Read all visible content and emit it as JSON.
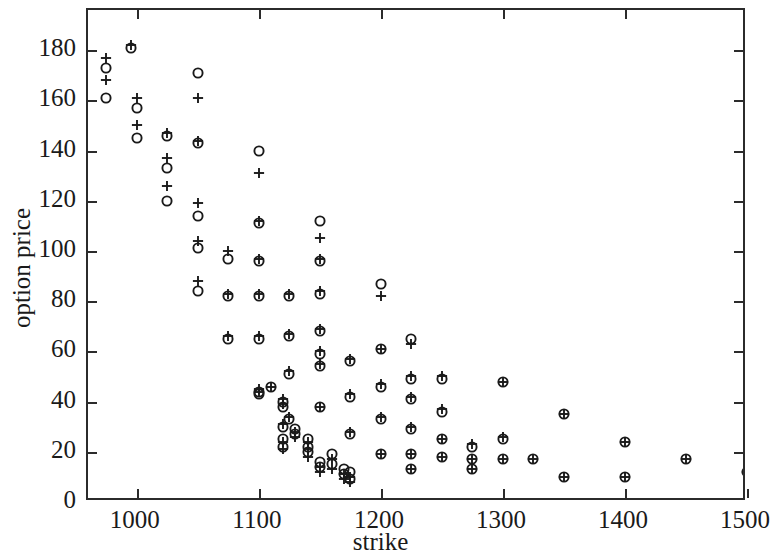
{
  "chart_data": {
    "type": "scatter",
    "title": "",
    "xlabel": "strike",
    "ylabel": "option price",
    "xlim": [
      960,
      1500
    ],
    "ylim": [
      0,
      196
    ],
    "grid": false,
    "legend": null,
    "xticks": [
      1000,
      1100,
      1200,
      1300,
      1400,
      1500
    ],
    "yticks": [
      0,
      20,
      40,
      60,
      80,
      100,
      120,
      140,
      160,
      180
    ],
    "series": [
      {
        "name": "circle",
        "marker": "o",
        "points": [
          [
            975,
            173
          ],
          [
            975,
            161
          ],
          [
            995,
            181
          ],
          [
            1000,
            157
          ],
          [
            1000,
            145
          ],
          [
            1025,
            146
          ],
          [
            1025,
            133
          ],
          [
            1025,
            120
          ],
          [
            1050,
            171
          ],
          [
            1050,
            143
          ],
          [
            1050,
            114
          ],
          [
            1050,
            101
          ],
          [
            1050,
            84
          ],
          [
            1075,
            97
          ],
          [
            1075,
            82
          ],
          [
            1075,
            65
          ],
          [
            1100,
            140
          ],
          [
            1100,
            111
          ],
          [
            1100,
            96
          ],
          [
            1100,
            82
          ],
          [
            1100,
            65
          ],
          [
            1100,
            44
          ],
          [
            1100,
            43
          ],
          [
            1110,
            46
          ],
          [
            1120,
            40
          ],
          [
            1120,
            38
          ],
          [
            1120,
            30
          ],
          [
            1120,
            25
          ],
          [
            1120,
            22
          ],
          [
            1125,
            82
          ],
          [
            1125,
            66
          ],
          [
            1125,
            51
          ],
          [
            1125,
            33
          ],
          [
            1130,
            29
          ],
          [
            1130,
            27
          ],
          [
            1140,
            25
          ],
          [
            1140,
            22
          ],
          [
            1140,
            20
          ],
          [
            1150,
            112
          ],
          [
            1150,
            96
          ],
          [
            1150,
            83
          ],
          [
            1150,
            68
          ],
          [
            1150,
            59
          ],
          [
            1150,
            54
          ],
          [
            1150,
            38
          ],
          [
            1150,
            16
          ],
          [
            1150,
            14
          ],
          [
            1160,
            19
          ],
          [
            1160,
            15
          ],
          [
            1170,
            13
          ],
          [
            1170,
            11
          ],
          [
            1175,
            56
          ],
          [
            1175,
            42
          ],
          [
            1175,
            27
          ],
          [
            1175,
            12
          ],
          [
            1175,
            9
          ],
          [
            1200,
            87
          ],
          [
            1200,
            61
          ],
          [
            1200,
            46
          ],
          [
            1200,
            33
          ],
          [
            1200,
            19
          ],
          [
            1225,
            65
          ],
          [
            1225,
            49
          ],
          [
            1225,
            41
          ],
          [
            1225,
            29
          ],
          [
            1225,
            19
          ],
          [
            1225,
            13
          ],
          [
            1250,
            49
          ],
          [
            1250,
            36
          ],
          [
            1250,
            25
          ],
          [
            1250,
            18
          ],
          [
            1275,
            22
          ],
          [
            1275,
            17
          ],
          [
            1275,
            13
          ],
          [
            1300,
            48
          ],
          [
            1300,
            25
          ],
          [
            1300,
            17
          ],
          [
            1325,
            17
          ],
          [
            1350,
            35
          ],
          [
            1350,
            10
          ],
          [
            1400,
            24
          ],
          [
            1400,
            10
          ],
          [
            1450,
            17
          ],
          [
            1500,
            12
          ]
        ]
      },
      {
        "name": "plus",
        "marker": "+",
        "points": [
          [
            975,
            177
          ],
          [
            975,
            168
          ],
          [
            995,
            182
          ],
          [
            1000,
            161
          ],
          [
            1000,
            150
          ],
          [
            1025,
            147
          ],
          [
            1025,
            137
          ],
          [
            1025,
            126
          ],
          [
            1050,
            161
          ],
          [
            1050,
            144
          ],
          [
            1050,
            119
          ],
          [
            1050,
            104
          ],
          [
            1050,
            88
          ],
          [
            1075,
            100
          ],
          [
            1075,
            83
          ],
          [
            1075,
            66
          ],
          [
            1100,
            131
          ],
          [
            1100,
            112
          ],
          [
            1100,
            97
          ],
          [
            1100,
            83
          ],
          [
            1100,
            66
          ],
          [
            1100,
            45
          ],
          [
            1100,
            44
          ],
          [
            1110,
            46
          ],
          [
            1120,
            41
          ],
          [
            1120,
            39
          ],
          [
            1120,
            31
          ],
          [
            1120,
            24
          ],
          [
            1120,
            21
          ],
          [
            1125,
            83
          ],
          [
            1125,
            67
          ],
          [
            1125,
            52
          ],
          [
            1125,
            34
          ],
          [
            1130,
            28
          ],
          [
            1130,
            26
          ],
          [
            1140,
            24
          ],
          [
            1140,
            21
          ],
          [
            1140,
            18
          ],
          [
            1150,
            105
          ],
          [
            1150,
            97
          ],
          [
            1150,
            84
          ],
          [
            1150,
            69
          ],
          [
            1150,
            60
          ],
          [
            1150,
            55
          ],
          [
            1150,
            38
          ],
          [
            1150,
            14
          ],
          [
            1150,
            12
          ],
          [
            1160,
            17
          ],
          [
            1160,
            13
          ],
          [
            1170,
            11
          ],
          [
            1170,
            9
          ],
          [
            1175,
            57
          ],
          [
            1175,
            43
          ],
          [
            1175,
            28
          ],
          [
            1175,
            10
          ],
          [
            1175,
            8
          ],
          [
            1200,
            82
          ],
          [
            1200,
            61
          ],
          [
            1200,
            47
          ],
          [
            1200,
            34
          ],
          [
            1200,
            19
          ],
          [
            1225,
            63
          ],
          [
            1225,
            50
          ],
          [
            1225,
            42
          ],
          [
            1225,
            30
          ],
          [
            1225,
            19
          ],
          [
            1225,
            13
          ],
          [
            1250,
            50
          ],
          [
            1250,
            37
          ],
          [
            1250,
            25
          ],
          [
            1250,
            18
          ],
          [
            1275,
            23
          ],
          [
            1275,
            17
          ],
          [
            1275,
            13
          ],
          [
            1300,
            48
          ],
          [
            1300,
            26
          ],
          [
            1300,
            17
          ],
          [
            1325,
            17
          ],
          [
            1350,
            35
          ],
          [
            1350,
            10
          ],
          [
            1400,
            24
          ],
          [
            1400,
            10
          ],
          [
            1450,
            17
          ],
          [
            1500,
            12
          ]
        ]
      }
    ]
  },
  "axes": {
    "x_title": "strike",
    "y_title": "option price",
    "x_tick_labels": [
      "1000",
      "1100",
      "1200",
      "1300",
      "1400",
      "1500"
    ],
    "y_tick_labels": [
      "0",
      "20",
      "40",
      "60",
      "80",
      "100",
      "120",
      "140",
      "160",
      "180"
    ]
  },
  "style": {
    "marker_color": "#1a1a1a",
    "axis_color": "#2b2b2b",
    "background": "#ffffff"
  }
}
